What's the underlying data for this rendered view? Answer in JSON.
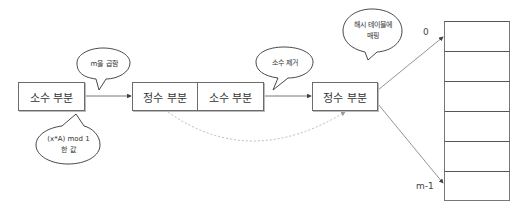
{
  "diagram": {
    "boxes": [
      {
        "id": "fraction-part-1",
        "label": "소수 부분"
      },
      {
        "id": "integer-part-1",
        "label": "정수 부분"
      },
      {
        "id": "fraction-part-2",
        "label": "소수 부분"
      },
      {
        "id": "integer-part-2",
        "label": "정수 부분"
      }
    ],
    "bubbles": {
      "multiply_m": "m을 곱함",
      "mod_value_line1": "(x*A) mod 1",
      "mod_value_line2": "한 값",
      "remove_fraction": "소수 제거",
      "map_hash_table_line1": "해시 테이블에",
      "map_hash_table_line2": "매핑"
    },
    "hash_table": {
      "rows": 6,
      "first_index_label": "0",
      "last_index_label": "m-1"
    },
    "colors": {
      "stroke": "#6b6b6b",
      "dashed": "#b0b0b0",
      "text": "#333333"
    }
  }
}
